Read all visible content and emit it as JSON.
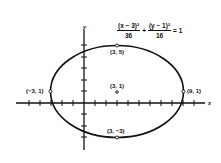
{
  "equation": {
    "term1_num": "(x − 3)²",
    "term1_den": "36",
    "plus": "+",
    "term2_num": "(y − 1)²",
    "term2_den": "16",
    "equals": "= 1"
  },
  "axes": {
    "x_label": "x",
    "y_label": "y"
  },
  "points": {
    "top": "(3, 5)",
    "center": "(3, 1)",
    "left": "(−3, 1)",
    "right": "(9, 1)",
    "bottom": "(3, −3)"
  },
  "ellipse": {
    "h": 3,
    "k": 1,
    "a": 6,
    "b": 4
  },
  "colors": {
    "ink": "#111111",
    "background": "#ffffff"
  }
}
